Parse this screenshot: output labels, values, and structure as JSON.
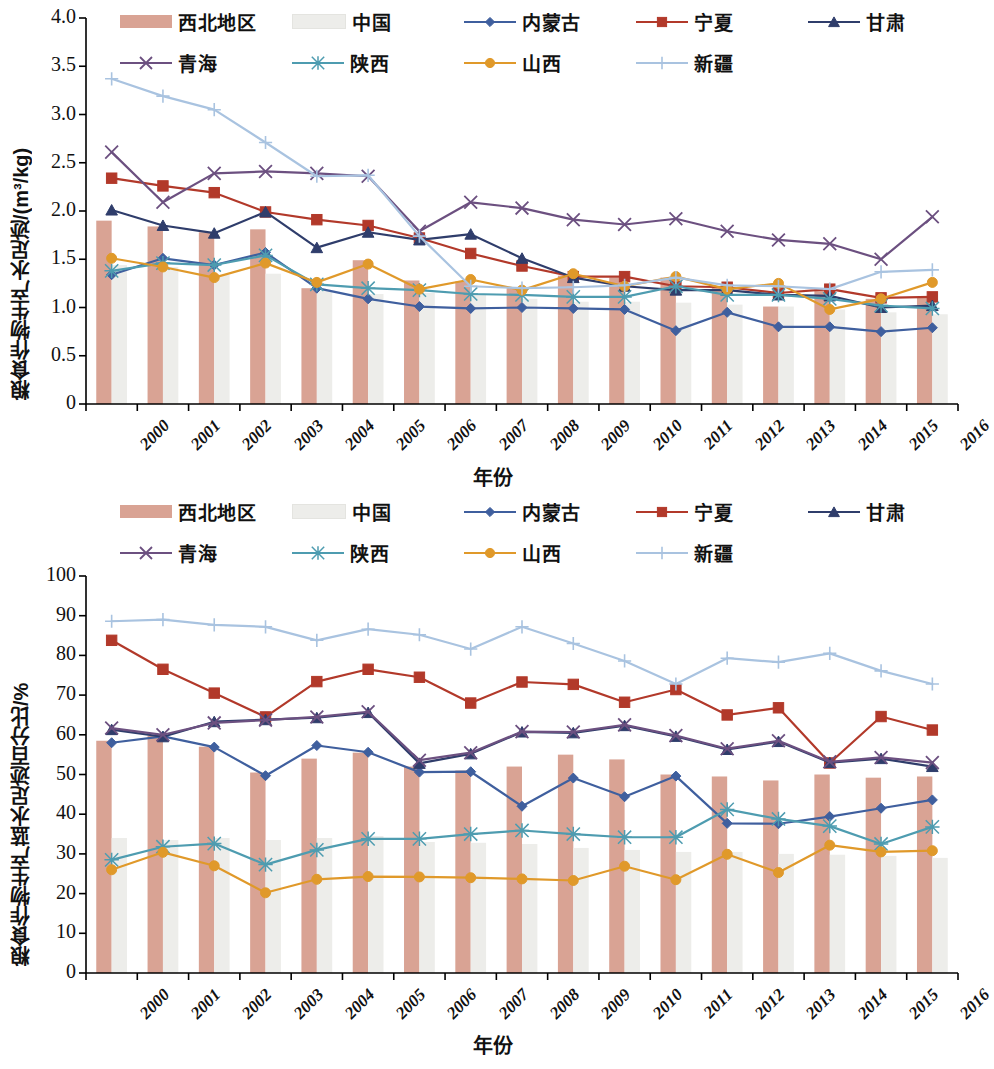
{
  "legend": {
    "items": [
      {
        "name": "northwest",
        "label": "西北地区",
        "type": "bar",
        "color": "#d9a394"
      },
      {
        "name": "china",
        "label": "中国",
        "type": "bar",
        "color": "#ededea"
      },
      {
        "name": "neimenggu",
        "label": "内蒙古",
        "type": "line",
        "color": "#3f5f9e",
        "marker": "diamond"
      },
      {
        "name": "ningxia",
        "label": "宁夏",
        "type": "line",
        "color": "#b2392a",
        "marker": "square"
      },
      {
        "name": "gansu",
        "label": "甘肃",
        "type": "line",
        "color": "#2f3d6b",
        "marker": "triangle"
      },
      {
        "name": "qinghai",
        "label": "青海",
        "type": "line",
        "color": "#6c5080",
        "marker": "cross"
      },
      {
        "name": "shaanxi",
        "label": "陕西",
        "type": "line",
        "color": "#4e9cb0",
        "marker": "star"
      },
      {
        "name": "shanxi",
        "label": "山西",
        "type": "line",
        "color": "#e0992a",
        "marker": "circle"
      },
      {
        "name": "xinjiang",
        "label": "新疆",
        "type": "line",
        "color": "#a9c3e0",
        "marker": "plus"
      }
    ]
  },
  "chart_data": [
    {
      "id": "top",
      "type": "bar",
      "title": "",
      "xlabel": "年份",
      "ylabel": "粮食作物生产水足迹/(m³/kg)",
      "ylim": [
        0,
        4.0
      ],
      "yticks": [
        "0",
        "0.5",
        "1.0",
        "1.5",
        "2.0",
        "2.5",
        "3.0",
        "3.5",
        "4.0"
      ],
      "grid": false,
      "legend_position": "top",
      "categories": [
        "2000",
        "2001",
        "2002",
        "2003",
        "2004",
        "2005",
        "2006",
        "2007",
        "2008",
        "2009",
        "2010",
        "2011",
        "2012",
        "2013",
        "2014",
        "2015",
        "2016"
      ],
      "bars": [
        {
          "name": "西北地区",
          "color": "#d9a394",
          "values": [
            1.9,
            1.84,
            1.78,
            1.81,
            1.2,
            1.49,
            1.28,
            1.27,
            1.2,
            1.33,
            1.31,
            1.31,
            1.21,
            1.01,
            1.19,
            1.09,
            1.1
          ]
        },
        {
          "name": "中国",
          "color": "#ededea",
          "values": [
            1.44,
            1.42,
            1.34,
            1.35,
            1.17,
            1.14,
            1.15,
            1.13,
            1.09,
            1.06,
            1.06,
            1.05,
            1.03,
            1.01,
            0.98,
            0.95,
            0.93
          ]
        }
      ],
      "series": [
        {
          "name": "内蒙古",
          "color": "#3f5f9e",
          "marker": "diamond",
          "values": [
            1.34,
            1.51,
            1.44,
            1.57,
            1.2,
            1.09,
            1.01,
            0.99,
            1.0,
            0.99,
            0.98,
            0.76,
            0.95,
            0.8,
            0.8,
            0.75,
            0.79
          ]
        },
        {
          "name": "宁夏",
          "color": "#b2392a",
          "marker": "square",
          "values": [
            2.34,
            2.26,
            2.19,
            1.99,
            1.91,
            1.85,
            1.72,
            1.56,
            1.43,
            1.32,
            1.32,
            1.22,
            1.21,
            1.15,
            1.19,
            1.1,
            1.11
          ]
        },
        {
          "name": "甘肃",
          "color": "#2f3d6b",
          "marker": "triangle",
          "values": [
            2.01,
            1.85,
            1.77,
            1.99,
            1.62,
            1.78,
            1.7,
            1.76,
            1.51,
            1.31,
            1.22,
            1.18,
            1.18,
            1.13,
            1.12,
            1.0,
            1.02
          ]
        },
        {
          "name": "青海",
          "color": "#6c5080",
          "marker": "cross",
          "values": [
            2.61,
            2.09,
            2.39,
            2.41,
            2.39,
            2.36,
            1.79,
            2.09,
            2.03,
            1.91,
            1.86,
            1.92,
            1.79,
            1.7,
            1.66,
            1.5,
            1.94
          ]
        },
        {
          "name": "陕西",
          "color": "#4e9cb0",
          "marker": "star",
          "values": [
            1.38,
            1.46,
            1.44,
            1.54,
            1.24,
            1.2,
            1.18,
            1.14,
            1.13,
            1.11,
            1.11,
            1.22,
            1.13,
            1.13,
            1.09,
            1.02,
            0.99
          ]
        },
        {
          "name": "山西",
          "color": "#e0992a",
          "marker": "circle",
          "values": [
            1.51,
            1.42,
            1.31,
            1.46,
            1.26,
            1.45,
            1.19,
            1.29,
            1.18,
            1.35,
            1.22,
            1.32,
            1.19,
            1.25,
            0.98,
            1.09,
            1.26
          ]
        },
        {
          "name": "新疆",
          "color": "#a9c3e0",
          "marker": "plus",
          "values": [
            3.37,
            3.19,
            3.05,
            2.71,
            2.36,
            2.37,
            1.74,
            1.22,
            1.2,
            1.21,
            1.23,
            1.31,
            1.23,
            1.22,
            1.19,
            1.37,
            1.39
          ]
        }
      ]
    },
    {
      "id": "bottom",
      "type": "bar",
      "title": "",
      "xlabel": "年份",
      "ylabel": "粮食作物生产蓝水足迹百分比/%",
      "ylim": [
        0,
        100
      ],
      "yticks": [
        "0",
        "10",
        "20",
        "30",
        "40",
        "50",
        "60",
        "70",
        "80",
        "90",
        "100"
      ],
      "grid": false,
      "legend_position": "top",
      "categories": [
        "2000",
        "2001",
        "2002",
        "2003",
        "2004",
        "2005",
        "2006",
        "2007",
        "2008",
        "2009",
        "2010",
        "2011",
        "2012",
        "2013",
        "2014",
        "2015",
        "2016"
      ],
      "bars": [
        {
          "name": "西北地区",
          "color": "#d9a394",
          "values": [
            58.5,
            59.8,
            57.0,
            50.5,
            54.0,
            55.5,
            52.0,
            51.0,
            52.0,
            55.0,
            53.8,
            50.0,
            49.5,
            48.5,
            50.0,
            49.2,
            49.5
          ]
        },
        {
          "name": "中国",
          "color": "#ededea",
          "values": [
            34.0,
            33.5,
            34.0,
            33.5,
            34.0,
            34.5,
            33.0,
            32.8,
            32.5,
            31.5,
            31.0,
            30.5,
            30.5,
            30.0,
            29.8,
            29.5,
            29.0
          ]
        }
      ],
      "series": [
        {
          "name": "内蒙古",
          "color": "#3f5f9e",
          "marker": "diamond",
          "values": [
            58.0,
            59.6,
            56.9,
            49.7,
            57.3,
            55.6,
            50.6,
            50.7,
            42.0,
            49.1,
            44.4,
            49.6,
            37.7,
            37.6,
            39.4,
            41.5,
            43.6
          ]
        },
        {
          "name": "宁夏",
          "color": "#b2392a",
          "marker": "square",
          "values": [
            83.8,
            76.5,
            70.5,
            64.5,
            73.4,
            76.5,
            74.5,
            68.0,
            73.3,
            72.7,
            68.2,
            71.4,
            65.0,
            66.8,
            52.9,
            64.6,
            61.2
          ]
        },
        {
          "name": "甘肃",
          "color": "#2f3d6b",
          "marker": "triangle",
          "values": [
            61.3,
            59.5,
            63.3,
            63.8,
            64.3,
            65.6,
            52.8,
            55.2,
            60.7,
            60.5,
            62.3,
            59.6,
            56.3,
            58.3,
            53.0,
            54.0,
            52.0
          ]
        },
        {
          "name": "青海",
          "color": "#6c5080",
          "marker": "cross",
          "values": [
            61.7,
            60.0,
            63.0,
            63.7,
            64.5,
            65.8,
            53.6,
            55.5,
            60.8,
            60.7,
            62.5,
            59.8,
            56.5,
            58.5,
            53.2,
            54.3,
            53.0
          ]
        },
        {
          "name": "陕西",
          "color": "#4e9cb0",
          "marker": "star",
          "values": [
            28.5,
            31.8,
            32.6,
            27.3,
            31.0,
            33.8,
            33.8,
            35.0,
            35.9,
            35.0,
            34.2,
            34.2,
            41.2,
            38.8,
            37.0,
            32.5,
            36.8
          ]
        },
        {
          "name": "山西",
          "color": "#e0992a",
          "marker": "circle",
          "values": [
            26.0,
            30.4,
            27.0,
            20.2,
            23.6,
            24.3,
            24.2,
            24.0,
            23.7,
            23.3,
            26.9,
            23.5,
            29.9,
            25.3,
            32.2,
            30.5,
            30.8
          ]
        },
        {
          "name": "新疆",
          "color": "#a9c3e0",
          "marker": "plus",
          "values": [
            88.6,
            89.0,
            87.7,
            87.2,
            83.8,
            86.6,
            85.2,
            81.6,
            87.2,
            83.0,
            78.6,
            72.8,
            79.3,
            78.3,
            80.5,
            76.1,
            72.8
          ]
        }
      ]
    }
  ]
}
